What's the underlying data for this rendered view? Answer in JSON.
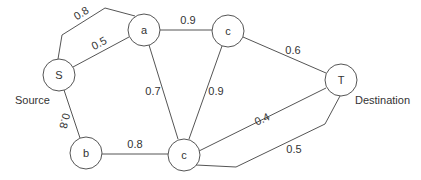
{
  "diagram": {
    "type": "weighted-graph",
    "nodes": [
      {
        "id": "S",
        "label": "S",
        "x": 59,
        "y": 75
      },
      {
        "id": "a",
        "label": "a",
        "x": 144,
        "y": 30
      },
      {
        "id": "c1",
        "label": "c",
        "x": 228,
        "y": 31
      },
      {
        "id": "T",
        "label": "T",
        "x": 341,
        "y": 80
      },
      {
        "id": "b",
        "label": "b",
        "x": 86,
        "y": 153
      },
      {
        "id": "c2",
        "label": "c",
        "x": 184,
        "y": 155
      }
    ],
    "edges": [
      {
        "from": "S",
        "to": "a",
        "weight": "0.8",
        "route": "bent-top"
      },
      {
        "from": "S",
        "to": "a",
        "weight": "0.5"
      },
      {
        "from": "a",
        "to": "c1",
        "weight": "0.9"
      },
      {
        "from": "c1",
        "to": "T",
        "weight": "0.6"
      },
      {
        "from": "a",
        "to": "c2",
        "weight": "0.7"
      },
      {
        "from": "c1",
        "to": "c2",
        "weight": "0.9"
      },
      {
        "from": "S",
        "to": "b",
        "weight": "0.8"
      },
      {
        "from": "b",
        "to": "c2",
        "weight": "0.8"
      },
      {
        "from": "c2",
        "to": "T",
        "weight": "0.4"
      },
      {
        "from": "c2",
        "to": "T",
        "weight": "0.5",
        "route": "bent-bottom"
      }
    ],
    "annotations": {
      "source": "Source",
      "destination": "Destination"
    }
  }
}
